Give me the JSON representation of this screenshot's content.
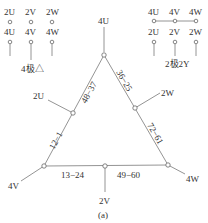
{
  "legend_4pole": {
    "row1": [
      "2U",
      "2V",
      "2W"
    ],
    "row2": [
      "4U",
      "4V",
      "4W"
    ],
    "caption": "4极△"
  },
  "legend_2pole": {
    "row1": [
      "4U",
      "4V",
      "4W"
    ],
    "row2": [
      "2U",
      "2V",
      "2W"
    ],
    "caption": "2极2Y"
  },
  "triangle": {
    "vertex_top": "4U",
    "vertex_left": "4V",
    "vertex_right": "4W",
    "mid_left": "2U",
    "mid_right": "2W",
    "mid_bottom": "2V",
    "edges": {
      "top_left": "48−37",
      "top_right": "36−25",
      "left_lower": "12−1",
      "right_lower": "72−61",
      "bottom_left": "13−24",
      "bottom_right": "49−60"
    }
  },
  "caption": "(a)"
}
